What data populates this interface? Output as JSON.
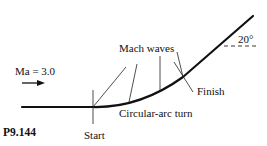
{
  "figure": {
    "id_label": "P9.144",
    "inflow_label": "Ma = 3.0",
    "mach_waves_label": "Mach waves",
    "start_label": "Start",
    "arc_label": "Circular-arc turn",
    "finish_label": "Finish",
    "angle_label": "20°"
  },
  "colors": {
    "stroke": "#111111",
    "background": "#ffffff"
  }
}
